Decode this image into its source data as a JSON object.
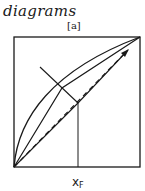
{
  "header": {
    "title": "diagrams",
    "panel_label": "[a]"
  },
  "diagram": {
    "x_axis_label": "x",
    "x_axis_subscript": "F",
    "stroke_color": "#1a1a1a",
    "background_color": "#ffffff",
    "elements": [
      {
        "name": "frame",
        "type": "rectangle"
      },
      {
        "name": "equilibrium-curve",
        "type": "curve"
      },
      {
        "name": "upper-operating-line",
        "type": "solid-line"
      },
      {
        "name": "lower-operating-line",
        "type": "solid-line"
      },
      {
        "name": "diagonal-dashed-line",
        "type": "dashed-line-with-arrow"
      },
      {
        "name": "feed-q-line",
        "type": "solid-line"
      },
      {
        "name": "feed-composition-line",
        "type": "vertical-line"
      }
    ]
  }
}
